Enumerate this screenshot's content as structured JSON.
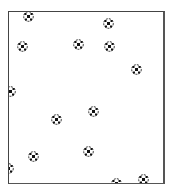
{
  "game": {
    "field": {
      "x": 8,
      "y": 11,
      "width": 154,
      "height": 171,
      "border_color": "#444444",
      "background": "#ffffff"
    },
    "ball_icon": "soccer-ball-icon",
    "balls": [
      {
        "x": 28,
        "y": 16
      },
      {
        "x": 108,
        "y": 23
      },
      {
        "x": 22,
        "y": 46
      },
      {
        "x": 78,
        "y": 44
      },
      {
        "x": 109,
        "y": 46
      },
      {
        "x": 136,
        "y": 69
      },
      {
        "x": 10,
        "y": 91
      },
      {
        "x": 56,
        "y": 119
      },
      {
        "x": 93,
        "y": 111
      },
      {
        "x": 33,
        "y": 156
      },
      {
        "x": 88,
        "y": 151
      },
      {
        "x": 8,
        "y": 168
      },
      {
        "x": 116,
        "y": 183
      },
      {
        "x": 143,
        "y": 179
      }
    ]
  }
}
